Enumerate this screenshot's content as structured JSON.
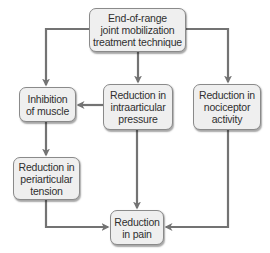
{
  "diagram": {
    "colors": {
      "box_fill": "#efefef",
      "box_border": "#8a8a8a",
      "connector": "#737373",
      "text": "#2f2f2f"
    },
    "nodes": [
      {
        "id": "technique",
        "label": "End-of-range\njoint mobilization\ntreatment technique"
      },
      {
        "id": "inhibition",
        "label": "Inhibition\nof muscle"
      },
      {
        "id": "intraarticular",
        "label": "Reduction in\nintraarticular\npressure"
      },
      {
        "id": "nociceptor",
        "label": "Reduction in\nnociceptor\nactivity"
      },
      {
        "id": "periarticular",
        "label": "Reduction in\nperiarticular\ntension"
      },
      {
        "id": "pain",
        "label": "Reduction\nin pain"
      }
    ],
    "edges": [
      {
        "from": "technique",
        "to": "inhibition"
      },
      {
        "from": "technique",
        "to": "intraarticular"
      },
      {
        "from": "technique",
        "to": "nociceptor"
      },
      {
        "from": "intraarticular",
        "to": "inhibition"
      },
      {
        "from": "inhibition",
        "to": "periarticular"
      },
      {
        "from": "intraarticular",
        "to": "pain"
      },
      {
        "from": "nociceptor",
        "to": "pain"
      },
      {
        "from": "periarticular",
        "to": "pain"
      }
    ]
  }
}
